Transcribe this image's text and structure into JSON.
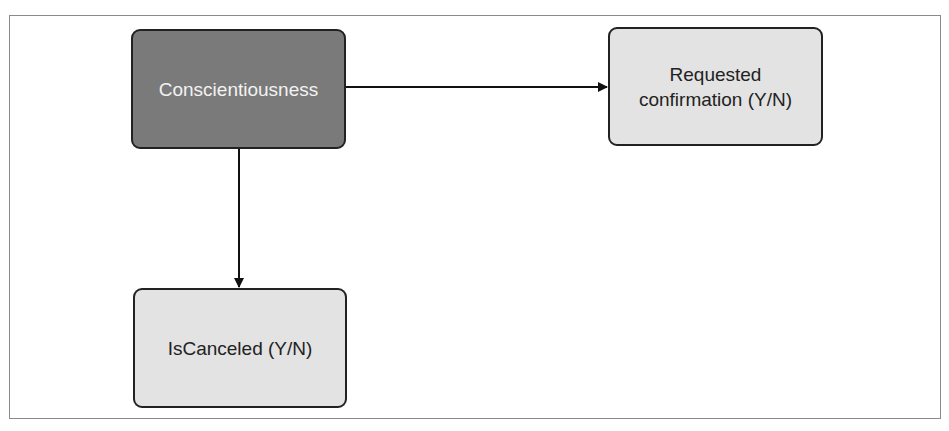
{
  "diagram": {
    "nodes": [
      {
        "id": "conscientiousness",
        "label": "Conscientiousness",
        "style": "dark",
        "fill": "#7a7a7a"
      },
      {
        "id": "requested_confirmation",
        "label": "Requested confirmation (Y/N)",
        "line1": "Requested",
        "line2": "confirmation (Y/N)",
        "style": "light",
        "fill": "#e3e3e3"
      },
      {
        "id": "is_canceled",
        "label": "IsCanceled (Y/N)",
        "style": "light",
        "fill": "#e3e3e3"
      }
    ],
    "edges": [
      {
        "from": "conscientiousness",
        "to": "requested_confirmation"
      },
      {
        "from": "conscientiousness",
        "to": "is_canceled"
      }
    ]
  }
}
